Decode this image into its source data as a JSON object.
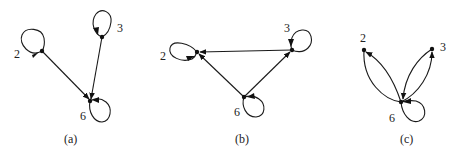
{
  "figure": {
    "panels": [
      {
        "caption": "(a)",
        "nodes": [
          {
            "id": "2",
            "label": "2"
          },
          {
            "id": "3",
            "label": "3"
          },
          {
            "id": "6",
            "label": "6"
          }
        ],
        "edges": [
          {
            "from": "2",
            "to": "2",
            "type": "self-loop"
          },
          {
            "from": "3",
            "to": "3",
            "type": "self-loop"
          },
          {
            "from": "6",
            "to": "6",
            "type": "self-loop"
          },
          {
            "from": "2",
            "to": "6",
            "type": "directed"
          },
          {
            "from": "3",
            "to": "6",
            "type": "directed"
          }
        ]
      },
      {
        "caption": "(b)",
        "nodes": [
          {
            "id": "2",
            "label": "2"
          },
          {
            "id": "3",
            "label": "3"
          },
          {
            "id": "6",
            "label": "6"
          }
        ],
        "edges": [
          {
            "from": "2",
            "to": "2",
            "type": "self-loop"
          },
          {
            "from": "3",
            "to": "3",
            "type": "self-loop"
          },
          {
            "from": "6",
            "to": "6",
            "type": "self-loop"
          },
          {
            "from": "3",
            "to": "2",
            "type": "directed"
          },
          {
            "from": "6",
            "to": "2",
            "type": "directed"
          },
          {
            "from": "6",
            "to": "3",
            "type": "directed"
          }
        ]
      },
      {
        "caption": "(c)",
        "nodes": [
          {
            "id": "2",
            "label": "2"
          },
          {
            "id": "3",
            "label": "3"
          },
          {
            "id": "6",
            "label": "6"
          }
        ],
        "edges": [
          {
            "from": "6",
            "to": "6",
            "type": "self-loop"
          },
          {
            "from": "6",
            "to": "2",
            "type": "directed-curved"
          },
          {
            "from": "6",
            "to": "3",
            "type": "directed-curved"
          },
          {
            "from": "3",
            "to": "6",
            "type": "directed-curved"
          }
        ]
      }
    ]
  }
}
